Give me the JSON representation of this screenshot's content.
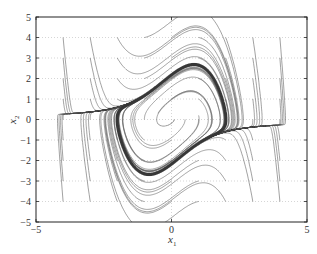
{
  "chart_data": {
    "type": "line",
    "title": "",
    "system": {
      "equations": [
        "x1' = x2",
        "x2' = -x1 + mu*(1 - x1^2)*x2"
      ],
      "mu": 1
    },
    "xlabel": "x1",
    "ylabel": "x2",
    "xlim": [
      -5,
      5
    ],
    "ylim": [
      -5,
      5
    ],
    "xticks": [
      -5,
      0,
      5
    ],
    "yticks": [
      -5,
      -4,
      -3,
      -2,
      -1,
      0,
      1,
      2,
      3,
      4,
      5
    ],
    "grid": {
      "x": [
        0
      ],
      "y": [
        -4,
        -3,
        -2,
        -1,
        0,
        1,
        2,
        3,
        4
      ],
      "style": "dotted"
    },
    "legend": null,
    "initial_conditions_grid": {
      "x1": [
        -4,
        -3,
        -2,
        -1,
        0,
        1,
        2,
        3,
        4
      ],
      "x2": [
        -4,
        -3,
        -2,
        -1,
        0,
        1,
        2,
        3,
        4
      ]
    },
    "limit_cycle": {
      "x1_range": [
        -2.0,
        2.0
      ],
      "x2_range": [
        -2.7,
        2.7
      ]
    },
    "line_color": "#555555",
    "limit_cycle_color": "#333333"
  },
  "axes": {
    "x_tick_labels": [
      "−5",
      "0",
      "5"
    ],
    "y_tick_labels": [
      "−5",
      "−4",
      "−3",
      "−2",
      "−1",
      "0",
      "1",
      "2",
      "3",
      "4",
      "5"
    ],
    "x_label_main": "x",
    "x_label_sub": "1",
    "y_label_main": "x",
    "y_label_sub": "2"
  }
}
